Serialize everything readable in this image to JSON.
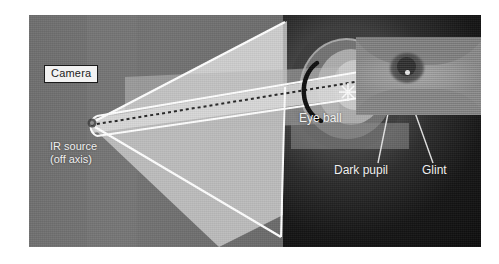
{
  "figure": {
    "plate": {
      "left": 29,
      "top": 15,
      "width": 452,
      "height": 232,
      "background_left_gray": "#727272",
      "background_right_dark": "#141414"
    }
  },
  "labels": {
    "camera": "Camera",
    "ir_source_line1": "IR source",
    "ir_source_line2": "(off axis)",
    "eye_ball": "Eye ball",
    "dark_pupil": "Dark pupil",
    "glint": "Glint"
  },
  "colors": {
    "label_box_fill": "#f2f2f2",
    "label_box_border": "#1a1a1a",
    "label_box_text": "#1c1c1c",
    "white_label_text": "#f0f0f0",
    "beam_fill": "#d3d3d3",
    "cone_fill": "#c9c9c9",
    "beam_outline": "#ffffff",
    "optical_axis": "#2a2a2a",
    "eyeball_highlight": "#c6c6c6",
    "cornea_arc": "#121212",
    "glint_star": "#fafafa",
    "leader_line": "#e8e8e8"
  },
  "geometry": {
    "ir_source_point": [
      63,
      107
    ],
    "eye_center": [
      83,
      68
    ],
    "glint_point": [
      319,
      77
    ],
    "optical_axis_from": [
      63,
      110
    ],
    "optical_axis_to": [
      330,
      68
    ],
    "eye_inset": {
      "left": 327,
      "top": 22,
      "width": 125,
      "height": 78
    },
    "dark_pupil_leader": {
      "from": [
        378,
        160
      ],
      "to": [
        394,
        58
      ]
    },
    "glint_leader": {
      "from": [
        432,
        160
      ],
      "to": [
        402,
        58
      ]
    }
  }
}
